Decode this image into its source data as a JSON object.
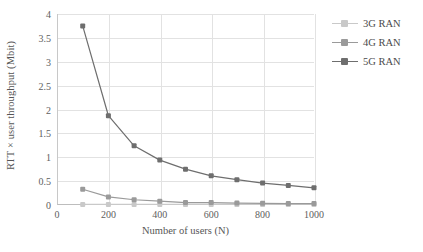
{
  "chart_data": {
    "type": "line",
    "title": "",
    "xlabel": "Number of users (N)",
    "ylabel": "RTT × user throughput (Mbit)",
    "x": [
      100,
      200,
      300,
      400,
      500,
      600,
      700,
      800,
      900,
      1000
    ],
    "xlim": [
      0,
      1000
    ],
    "ylim": [
      0,
      4
    ],
    "xticks": [
      0,
      200,
      400,
      600,
      800,
      1000
    ],
    "xtick_labels": [
      "0",
      "200",
      "400",
      "600",
      "800",
      "1000"
    ],
    "yticks": [
      0,
      0.5,
      1,
      1.5,
      2,
      2.5,
      3,
      3.5,
      4
    ],
    "ytick_labels": [
      "0",
      "0.5",
      "1",
      "1.5",
      "2",
      "2.5",
      "3",
      "3.5",
      "4"
    ],
    "grid": true,
    "legend_position": "right",
    "series": [
      {
        "name": "3G RAN",
        "color": "#c9c9c9",
        "values": [
          0.012,
          0.011,
          0.011,
          0.011,
          0.011,
          0.011,
          0.011,
          0.011,
          0.011,
          0.011
        ]
      },
      {
        "name": "4G RAN",
        "color": "#9a9a9a",
        "values": [
          0.33,
          0.17,
          0.11,
          0.08,
          0.05,
          0.05,
          0.04,
          0.035,
          0.03,
          0.03
        ]
      },
      {
        "name": "5G RAN",
        "color": "#6e6e6e",
        "values": [
          3.75,
          1.87,
          1.24,
          0.94,
          0.75,
          0.61,
          0.53,
          0.46,
          0.41,
          0.36
        ]
      }
    ]
  },
  "legend": {
    "items": [
      {
        "label": "3G RAN",
        "color": "#c9c9c9"
      },
      {
        "label": "4G RAN",
        "color": "#9a9a9a"
      },
      {
        "label": "5G RAN",
        "color": "#6e6e6e"
      }
    ]
  }
}
